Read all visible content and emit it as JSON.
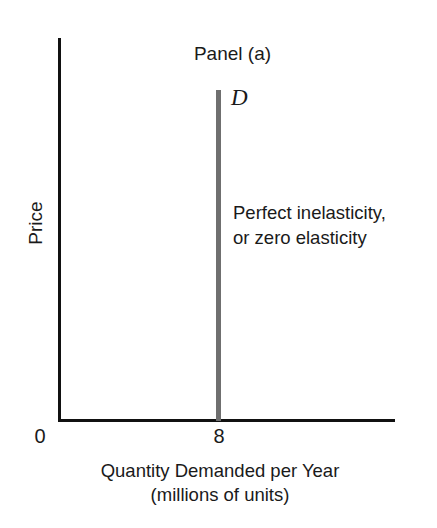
{
  "figure": {
    "title": "Panel (a)",
    "background_color": "#ffffff",
    "axis_color": "#111111",
    "curve_color": "#6f6f6f"
  },
  "annotation": {
    "line1": "Perfect inelasticity,",
    "line2": "or zero elasticity"
  },
  "curve": {
    "label": "D"
  },
  "axes": {
    "y_title": "Price",
    "x_title_line1": "Quantity Demanded per Year",
    "x_title_line2": "(millions of units)",
    "origin_label": "0",
    "x_tick_label": "8"
  },
  "chart_data": {
    "type": "line",
    "title": "Panel (a)",
    "subtitle": "",
    "xlabel": "Quantity Demanded per Year (millions of units)",
    "ylabel": "Price",
    "grid": false,
    "legend": "none",
    "xlim": [
      0,
      14
    ],
    "ylim": [
      0,
      10
    ],
    "xticks": [
      0,
      8
    ],
    "xticklabels": [
      "0",
      "8"
    ],
    "yticks": [],
    "yticklabels": [],
    "series": [
      {
        "name": "D",
        "description": "Perfectly inelastic demand curve: vertical line at quantity = 8 million units",
        "x": [
          8,
          8
        ],
        "y": [
          0,
          10
        ],
        "color": "#6f6f6f",
        "linewidth": 5,
        "label": "D",
        "label_position": {
          "x": 8,
          "y": 10
        }
      }
    ],
    "annotations": [
      {
        "text": "Perfect inelasticity, or zero elasticity",
        "x": 8.6,
        "y": 6.2
      }
    ]
  }
}
